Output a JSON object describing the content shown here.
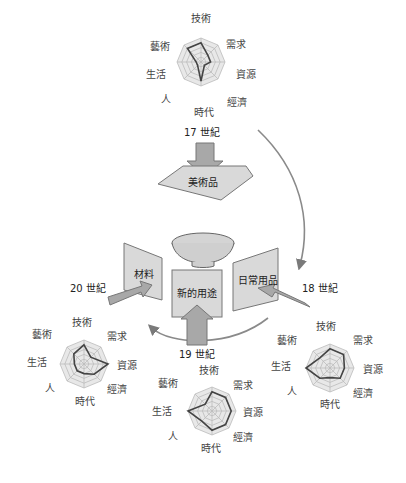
{
  "axes": [
    "技術",
    "需求",
    "資源",
    "經濟",
    "時代",
    "人",
    "生活",
    "藝術"
  ],
  "centuries": {
    "c17": "17 世紀",
    "c18": "18 世紀",
    "c19": "19 世紀",
    "c20": "20 世紀"
  },
  "panels": {
    "art": "美術品",
    "daily": "日常用品",
    "new_use": "新的用途",
    "material": "材料"
  },
  "colors": {
    "panel_fill": "#d9d9d9",
    "panel_stroke": "#777777",
    "arrow_fill": "#a8a8a8",
    "arrow_stroke": "#777777",
    "curve": "#8a8a8a",
    "radar_grid": "#bbbbbb",
    "radar_fill": "#e8e8e8",
    "radar_line": "#444444"
  },
  "chart_data": [
    {
      "type": "radar",
      "title": "17 世紀",
      "categories": [
        "技術",
        "需求",
        "資源",
        "經濟",
        "時代",
        "人",
        "生活",
        "藝術"
      ],
      "scale_max": 5,
      "values": [
        4,
        2,
        2,
        1,
        4,
        1,
        1,
        4
      ]
    },
    {
      "type": "radar",
      "title": "18 世紀",
      "categories": [
        "技術",
        "需求",
        "資源",
        "經濟",
        "時代",
        "人",
        "生活",
        "藝術"
      ],
      "scale_max": 5,
      "values": [
        4,
        4,
        3,
        3,
        2,
        3,
        5,
        3
      ]
    },
    {
      "type": "radar",
      "title": "19 世紀",
      "categories": [
        "技術",
        "需求",
        "資源",
        "經濟",
        "時代",
        "人",
        "生活",
        "藝術"
      ],
      "scale_max": 5,
      "values": [
        4,
        4,
        4,
        4,
        4,
        3,
        5,
        2
      ]
    },
    {
      "type": "radar",
      "title": "20 世紀",
      "categories": [
        "技術",
        "需求",
        "資源",
        "經濟",
        "時代",
        "人",
        "生活",
        "藝術"
      ],
      "scale_max": 5,
      "values": [
        4,
        2,
        5,
        3,
        2,
        2,
        2,
        3
      ]
    }
  ]
}
